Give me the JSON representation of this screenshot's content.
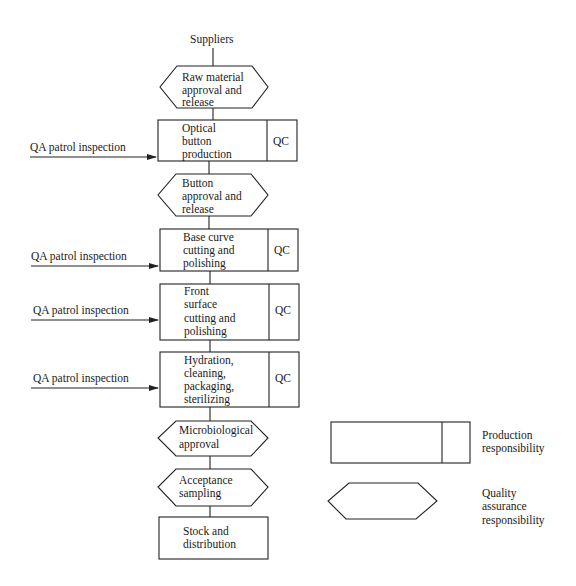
{
  "diagram": {
    "start_label": "Suppliers",
    "steps": [
      {
        "type": "qa",
        "lines": [
          "Raw material",
          "approval and",
          "release"
        ]
      },
      {
        "type": "production",
        "lines": [
          "Optical",
          "button",
          "production"
        ],
        "qc": "QC",
        "inspection": "QA patrol inspection"
      },
      {
        "type": "qa",
        "lines": [
          "Button",
          "approval and",
          "release"
        ]
      },
      {
        "type": "production",
        "lines": [
          "Base curve",
          "cutting and",
          "polishing"
        ],
        "qc": "QC",
        "inspection": "QA patrol inspection"
      },
      {
        "type": "production",
        "lines": [
          "Front",
          "surface",
          "cutting and",
          "polishing"
        ],
        "qc": "QC",
        "inspection": "QA patrol inspection"
      },
      {
        "type": "production",
        "lines": [
          "Hydration,",
          "cleaning,",
          "packaging,",
          "sterilizing"
        ],
        "qc": "QC",
        "inspection": "QA patrol inspection"
      },
      {
        "type": "qa",
        "lines": [
          "Microbiological",
          "approval"
        ]
      },
      {
        "type": "qa",
        "lines": [
          "Acceptance",
          "sampling"
        ]
      },
      {
        "type": "plain",
        "lines": [
          "Stock and",
          "distribution"
        ]
      }
    ]
  },
  "legend": {
    "production": {
      "lines": [
        "Production",
        "responsibility"
      ]
    },
    "qa": {
      "lines": [
        "Quality",
        "assurance",
        "responsibility"
      ]
    }
  },
  "colors": {
    "stroke": "#222222",
    "text": "#1a1a1a",
    "background": "#ffffff"
  }
}
